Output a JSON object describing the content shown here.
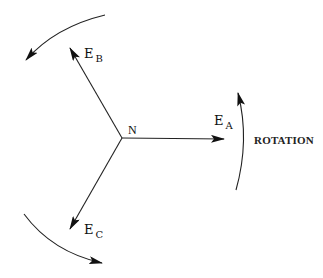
{
  "diagram": {
    "type": "three-phase phasor diagram",
    "center_label": "N",
    "phasors": [
      {
        "id": "A",
        "label_main": "E",
        "label_sub": "A"
      },
      {
        "id": "B",
        "label_main": "E",
        "label_sub": "B"
      },
      {
        "id": "C",
        "label_main": "E",
        "label_sub": "C"
      }
    ],
    "rotation_label": "ROTATION",
    "rotation_direction": "counter-clockwise",
    "colors": {
      "stroke": "#222222",
      "background": "#ffffff"
    }
  }
}
